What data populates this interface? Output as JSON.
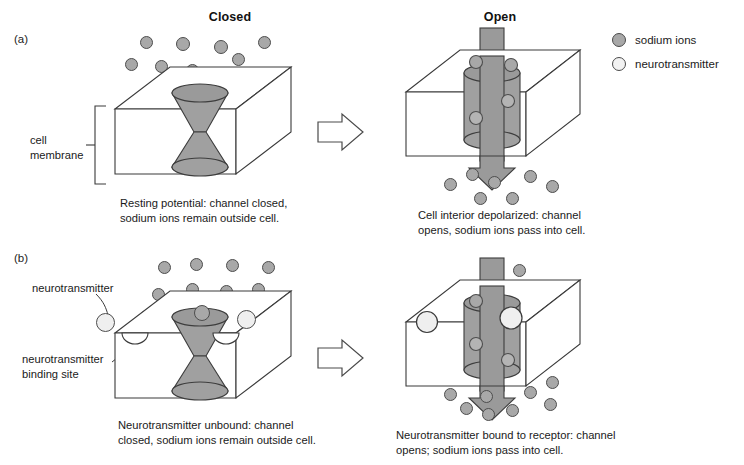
{
  "figure": {
    "top_cut_text": "",
    "column_headers": [
      {
        "label": "Closed"
      },
      {
        "label": "Open"
      }
    ],
    "legend": {
      "items": [
        {
          "icon": "sodium-ion-circle-icon",
          "label": "sodium ions",
          "fill": "#a8a8a8",
          "stroke": "#4a4a4a"
        },
        {
          "icon": "neurotransmitter-circle-icon",
          "label": "neurotransmitter",
          "fill": "#f2f2f2",
          "stroke": "#4a4a4a"
        }
      ]
    },
    "panels": [
      {
        "letter": "(a)",
        "side_labels": [
          {
            "name": "cell-membrane-label",
            "line1": "cell",
            "line2": "membrane"
          }
        ],
        "closed": {
          "state": "Closed",
          "channel_shape": "hourglass-double-cone",
          "caption_line1": "Resting potential: channel closed,",
          "caption_line2": "sodium ions remain outside cell."
        },
        "open": {
          "state": "Open",
          "channel_shape": "cylinder-with-downward-arrow",
          "caption_line1": "Cell interior depolarized: channel",
          "caption_line2": "opens, sodium ions pass into cell."
        },
        "transition_arrow": "hollow-right-arrow-icon"
      },
      {
        "letter": "(b)",
        "side_labels": [
          {
            "name": "neurotransmitter-label",
            "line1": "neurotransmitter",
            "line2": ""
          },
          {
            "name": "neurotransmitter-binding-site-label",
            "line1": "neurotransmitter",
            "line2": "binding site"
          }
        ],
        "closed": {
          "state": "Closed",
          "channel_shape": "hourglass-double-cone",
          "caption_line1": "Neurotransmitter unbound: channel",
          "caption_line2": "closed, sodium ions remain outside cell."
        },
        "open": {
          "state": "Open",
          "channel_shape": "cylinder-with-downward-arrow",
          "caption_line1": "Neurotransmitter bound to receptor: channel",
          "caption_line2": "opens; sodium ions pass into cell."
        },
        "transition_arrow": "hollow-right-arrow-icon"
      }
    ],
    "colors": {
      "ion_fill": "#a8a8a8",
      "ion_stroke": "#4d4d4d",
      "nt_fill": "#efefef",
      "channel_fill": "#a0a0a0",
      "channel_stroke": "#3d3d3d",
      "arrow_fill": "#9a9a9a",
      "box_stroke": "#3a3a3a",
      "text": "#1a1a1a"
    }
  }
}
